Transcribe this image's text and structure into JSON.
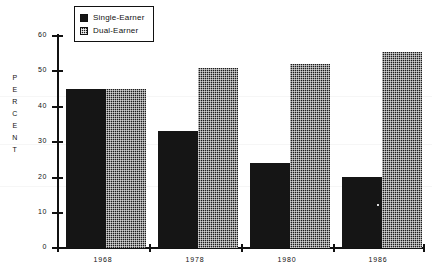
{
  "chart_data": {
    "type": "bar",
    "title": "",
    "xlabel": "",
    "ylabel": "PERCENT",
    "categories": [
      "1968",
      "1978",
      "1980",
      "1986"
    ],
    "series": [
      {
        "name": "Single-Earner",
        "values": [
          45,
          33,
          24,
          20
        ],
        "pattern": "solid",
        "color": "#151515"
      },
      {
        "name": "Dual-Earner",
        "values": [
          45,
          51,
          52,
          55.5
        ],
        "pattern": "dotted",
        "color": "#1c1c1c"
      }
    ],
    "ylim": [
      0,
      60
    ],
    "yticks": [
      0,
      10,
      20,
      30,
      40,
      50,
      60
    ],
    "ytick_labels": [
      "0",
      "10",
      "20",
      "30",
      "40",
      "50",
      "60"
    ],
    "grid": false,
    "legend_position": "top-center"
  },
  "axes": {
    "y_title_letters": [
      "P",
      "E",
      "R",
      "C",
      "E",
      "N",
      "T"
    ],
    "y_tick_labels": [
      "60",
      "50",
      "40",
      "30",
      "20",
      "10",
      "0"
    ],
    "x_tick_labels": [
      "1968",
      "1978",
      "1980",
      "1986"
    ]
  },
  "legend": {
    "items": [
      {
        "label": "Single-Earner",
        "pattern": "solid"
      },
      {
        "label": "Dual-Earner",
        "pattern": "dotted"
      }
    ]
  },
  "colors": {
    "ink": "#111111",
    "bar_solid": "#151515",
    "bar_dotted": "#1c1c1c",
    "background": "#ffffff"
  }
}
